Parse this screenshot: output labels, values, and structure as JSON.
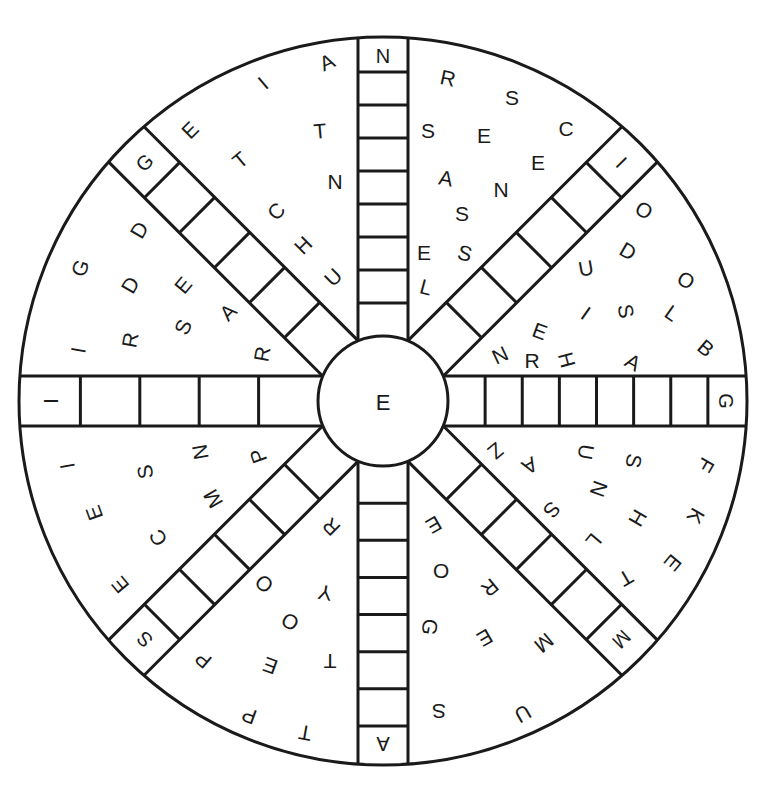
{
  "puzzle": {
    "type": "word-wheel",
    "center_letter": "E",
    "colors": {
      "ink": "#1a1a1a",
      "paper": "#ffffff"
    },
    "geometry": {
      "cx": 383,
      "cy": 401,
      "outer_r": 364,
      "inner_r": 65,
      "spoke_half_width": 25
    },
    "spokes": [
      {
        "id": "north",
        "angle": -90,
        "cells": 9,
        "given": "N",
        "given_position": "outer"
      },
      {
        "id": "north-east",
        "angle": -45,
        "cells": 6,
        "given": "I",
        "given_position": "outer"
      },
      {
        "id": "east",
        "angle": 0,
        "cells": 8,
        "given": "G",
        "given_position": "outer"
      },
      {
        "id": "south-east",
        "angle": 45,
        "cells": 6,
        "given": "M",
        "given_position": "outer"
      },
      {
        "id": "south",
        "angle": 90,
        "cells": 8,
        "given": "A",
        "given_position": "outer"
      },
      {
        "id": "south-west",
        "angle": 135,
        "cells": 6,
        "given": "S",
        "given_position": "outer"
      },
      {
        "id": "west",
        "angle": 180,
        "cells": 5,
        "given": "I",
        "given_position": "outer"
      },
      {
        "id": "north-west",
        "angle": -135,
        "cells": 6,
        "given": "G",
        "given_position": "outer"
      }
    ],
    "scattered_letters": [
      {
        "ch": "A",
        "x": 327,
        "y": 62,
        "rot": -25
      },
      {
        "ch": "I",
        "x": 263,
        "y": 83,
        "rot": -40
      },
      {
        "ch": "E",
        "x": 190,
        "y": 130,
        "rot": -45
      },
      {
        "ch": "T",
        "x": 320,
        "y": 131,
        "rot": -5
      },
      {
        "ch": "T",
        "x": 240,
        "y": 160,
        "rot": -40
      },
      {
        "ch": "N",
        "x": 335,
        "y": 181,
        "rot": 0
      },
      {
        "ch": "C",
        "x": 276,
        "y": 211,
        "rot": -45
      },
      {
        "ch": "H",
        "x": 303,
        "y": 245,
        "rot": -45
      },
      {
        "ch": "U",
        "x": 333,
        "y": 277,
        "rot": -45
      },
      {
        "ch": "G",
        "x": 80,
        "y": 268,
        "rot": -70
      },
      {
        "ch": "D",
        "x": 139,
        "y": 230,
        "rot": -60
      },
      {
        "ch": "D",
        "x": 130,
        "y": 285,
        "rot": -60
      },
      {
        "ch": "E",
        "x": 183,
        "y": 285,
        "rot": -50
      },
      {
        "ch": "I",
        "x": 78,
        "y": 350,
        "rot": -80
      },
      {
        "ch": "R",
        "x": 130,
        "y": 340,
        "rot": -80
      },
      {
        "ch": "S",
        "x": 183,
        "y": 327,
        "rot": -65
      },
      {
        "ch": "A",
        "x": 228,
        "y": 312,
        "rot": -45
      },
      {
        "ch": "R",
        "x": 262,
        "y": 354,
        "rot": -80
      },
      {
        "ch": "R",
        "x": 448,
        "y": 78,
        "rot": 12
      },
      {
        "ch": "S",
        "x": 512,
        "y": 97,
        "rot": 0
      },
      {
        "ch": "S",
        "x": 428,
        "y": 130,
        "rot": 0
      },
      {
        "ch": "E",
        "x": 484,
        "y": 135,
        "rot": 0
      },
      {
        "ch": "C",
        "x": 566,
        "y": 128,
        "rot": 0
      },
      {
        "ch": "E",
        "x": 538,
        "y": 162,
        "rot": 0
      },
      {
        "ch": "A",
        "x": 446,
        "y": 178,
        "rot": 10
      },
      {
        "ch": "N",
        "x": 501,
        "y": 189,
        "rot": 0
      },
      {
        "ch": "S",
        "x": 462,
        "y": 213,
        "rot": 0
      },
      {
        "ch": "E",
        "x": 424,
        "y": 252,
        "rot": 0
      },
      {
        "ch": "S",
        "x": 465,
        "y": 253,
        "rot": 15
      },
      {
        "ch": "L",
        "x": 426,
        "y": 287,
        "rot": 15
      },
      {
        "ch": "O",
        "x": 644,
        "y": 210,
        "rot": 30
      },
      {
        "ch": "D",
        "x": 628,
        "y": 251,
        "rot": 30
      },
      {
        "ch": "U",
        "x": 586,
        "y": 268,
        "rot": -10
      },
      {
        "ch": "O",
        "x": 686,
        "y": 280,
        "rot": 30
      },
      {
        "ch": "I",
        "x": 586,
        "y": 313,
        "rot": 35
      },
      {
        "ch": "S",
        "x": 626,
        "y": 311,
        "rot": 80
      },
      {
        "ch": "L",
        "x": 672,
        "y": 313,
        "rot": 35
      },
      {
        "ch": "E",
        "x": 540,
        "y": 331,
        "rot": 20
      },
      {
        "ch": "B",
        "x": 706,
        "y": 348,
        "rot": 40
      },
      {
        "ch": "N",
        "x": 500,
        "y": 355,
        "rot": -25
      },
      {
        "ch": "R",
        "x": 532,
        "y": 360,
        "rot": 0
      },
      {
        "ch": "H",
        "x": 567,
        "y": 360,
        "rot": 75
      },
      {
        "ch": "A",
        "x": 633,
        "y": 362,
        "rot": 30
      },
      {
        "ch": "I",
        "x": 67,
        "y": 466,
        "rot": -100
      },
      {
        "ch": "S",
        "x": 145,
        "y": 472,
        "rot": -100
      },
      {
        "ch": "N",
        "x": 200,
        "y": 452,
        "rot": -100
      },
      {
        "ch": "P",
        "x": 258,
        "y": 456,
        "rot": -110
      },
      {
        "ch": "E",
        "x": 94,
        "y": 513,
        "rot": -110
      },
      {
        "ch": "M",
        "x": 213,
        "y": 499,
        "rot": -120
      },
      {
        "ch": "C",
        "x": 158,
        "y": 538,
        "rot": -120
      },
      {
        "ch": "E",
        "x": 120,
        "y": 585,
        "rot": -130
      },
      {
        "ch": "R",
        "x": 331,
        "y": 527,
        "rot": -135
      },
      {
        "ch": "O",
        "x": 264,
        "y": 584,
        "rot": -140
      },
      {
        "ch": "Y",
        "x": 325,
        "y": 593,
        "rot": -170
      },
      {
        "ch": "O",
        "x": 290,
        "y": 622,
        "rot": -150
      },
      {
        "ch": "P",
        "x": 203,
        "y": 660,
        "rot": -140
      },
      {
        "ch": "E",
        "x": 270,
        "y": 666,
        "rot": -160
      },
      {
        "ch": "T",
        "x": 330,
        "y": 661,
        "rot": -180
      },
      {
        "ch": "P",
        "x": 249,
        "y": 716,
        "rot": -160
      },
      {
        "ch": "T",
        "x": 305,
        "y": 733,
        "rot": -170
      },
      {
        "ch": "Z",
        "x": 496,
        "y": 451,
        "rot": 140
      },
      {
        "ch": "A",
        "x": 530,
        "y": 466,
        "rot": 150
      },
      {
        "ch": "U",
        "x": 586,
        "y": 452,
        "rot": 100
      },
      {
        "ch": "S",
        "x": 634,
        "y": 461,
        "rot": 100
      },
      {
        "ch": "F",
        "x": 706,
        "y": 465,
        "rot": 120
      },
      {
        "ch": "N",
        "x": 599,
        "y": 489,
        "rot": 110
      },
      {
        "ch": "S",
        "x": 552,
        "y": 510,
        "rot": 130
      },
      {
        "ch": "H",
        "x": 638,
        "y": 518,
        "rot": 120
      },
      {
        "ch": "K",
        "x": 696,
        "y": 516,
        "rot": 120
      },
      {
        "ch": "L",
        "x": 594,
        "y": 541,
        "rot": 130
      },
      {
        "ch": "E",
        "x": 673,
        "y": 563,
        "rot": 130
      },
      {
        "ch": "T",
        "x": 626,
        "y": 578,
        "rot": 150
      },
      {
        "ch": "E",
        "x": 434,
        "y": 525,
        "rot": 150
      },
      {
        "ch": "O",
        "x": 441,
        "y": 571,
        "rot": 180
      },
      {
        "ch": "R",
        "x": 490,
        "y": 588,
        "rot": 140
      },
      {
        "ch": "G",
        "x": 430,
        "y": 627,
        "rot": 100
      },
      {
        "ch": "E",
        "x": 485,
        "y": 638,
        "rot": 150
      },
      {
        "ch": "M",
        "x": 544,
        "y": 643,
        "rot": 140
      },
      {
        "ch": "S",
        "x": 439,
        "y": 711,
        "rot": 180
      },
      {
        "ch": "U",
        "x": 523,
        "y": 714,
        "rot": 150
      }
    ]
  }
}
